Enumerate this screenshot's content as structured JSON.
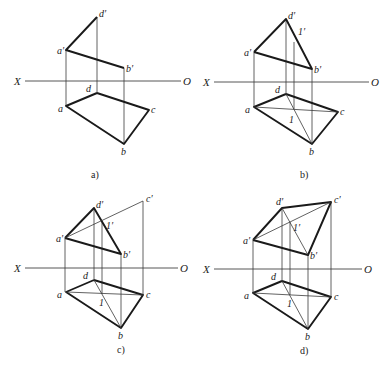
{
  "figure": {
    "panels": [
      {
        "id": "a",
        "caption": "a)",
        "axis": {
          "left": "X",
          "right": "O"
        },
        "points": {
          "d'": "d′",
          "a'": "a′",
          "b'": "b′",
          "d": "d",
          "a": "a",
          "c": "c",
          "b": "b"
        }
      },
      {
        "id": "b",
        "caption": "b)",
        "axis": {
          "left": "X",
          "right": "O"
        },
        "points": {
          "d'": "d′",
          "a'": "a′",
          "b'": "b′",
          "1'": "1′",
          "d": "d",
          "a": "a",
          "c": "c",
          "b": "b",
          "1": "1"
        }
      },
      {
        "id": "c",
        "caption": "c)",
        "axis": {
          "left": "X",
          "right": "O"
        },
        "points": {
          "d'": "d′",
          "a'": "a′",
          "b'": "b′",
          "c'": "c′",
          "1'": "1′",
          "d": "d",
          "a": "a",
          "c": "c",
          "b": "b",
          "1": "1"
        }
      },
      {
        "id": "d",
        "caption": "d)",
        "axis": {
          "left": "X",
          "right": "O"
        },
        "points": {
          "d'": "d′",
          "a'": "a′",
          "b'": "b′",
          "c'": "c′",
          "1'": "1′",
          "d": "d",
          "a": "a",
          "c": "c",
          "b": "b",
          "1": "1"
        }
      }
    ]
  }
}
